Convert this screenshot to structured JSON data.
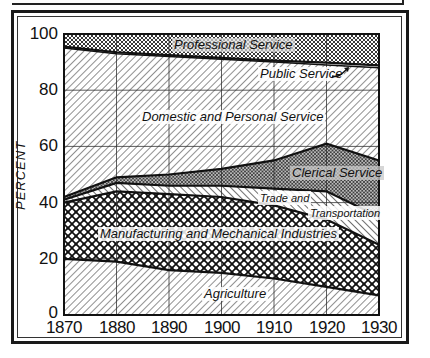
{
  "chart_data": {
    "type": "area",
    "stacked": true,
    "title": "",
    "xlabel": "",
    "ylabel": "PERCENT",
    "x": [
      1870,
      1880,
      1890,
      1900,
      1910,
      1920,
      1930
    ],
    "x_tick_labels": [
      "1870",
      "1880",
      "1890",
      "1900",
      "1910",
      "1920",
      "1930"
    ],
    "y_tick_labels": [
      "0",
      "20",
      "40",
      "60",
      "80",
      "100"
    ],
    "ylim": [
      0,
      100
    ],
    "grid": true,
    "legend_position": "inline labels",
    "series": [
      {
        "name": "Agriculture",
        "values": [
          20,
          19,
          16,
          15,
          13,
          10,
          7
        ]
      },
      {
        "name": "Manufacturing and Mechanical Industries",
        "values": [
          20,
          25,
          27,
          27,
          26,
          24,
          18
        ]
      },
      {
        "name": "Trade and Transportation",
        "values": [
          1,
          3,
          3,
          4,
          6,
          10,
          10
        ]
      },
      {
        "name": "Clerical Service",
        "values": [
          1,
          2,
          4,
          6,
          10,
          17,
          20
        ]
      },
      {
        "name": "Domestic and Personal Service",
        "values": [
          53,
          44,
          42,
          39,
          35,
          28,
          33
        ]
      },
      {
        "name": "Public Service",
        "values": [
          0.5,
          0.5,
          0.5,
          0.5,
          0.5,
          0.8,
          0.8
        ]
      },
      {
        "name": "Professional Service",
        "values": [
          4.5,
          6.5,
          7.5,
          8.5,
          9.5,
          10.2,
          11.2
        ]
      }
    ],
    "cumulative_boundaries": {
      "agriculture_top": [
        20,
        19,
        16,
        15,
        13,
        10,
        7
      ],
      "manufacturing_top": [
        40,
        44,
        43,
        42,
        39,
        34,
        25
      ],
      "trade_top": [
        41,
        47,
        46,
        46,
        45,
        44,
        35
      ],
      "clerical_top": [
        42,
        49,
        50,
        52,
        55,
        61,
        55
      ],
      "domestic_top": [
        95,
        93,
        92,
        91,
        90,
        89,
        88
      ],
      "public_top": [
        95.5,
        93.5,
        92.5,
        91.5,
        90.5,
        89.8,
        88.8
      ]
    }
  },
  "labels": {
    "professional": "Professional Service",
    "public": "Public Service",
    "domestic": "Domestic and Personal Service",
    "clerical": "Clerical Service",
    "trade_line1": "Trade  and",
    "trade_line2": "Transportation",
    "manufacturing": "Manufacturing and Mechanical Industries",
    "agriculture": "Agriculture"
  }
}
